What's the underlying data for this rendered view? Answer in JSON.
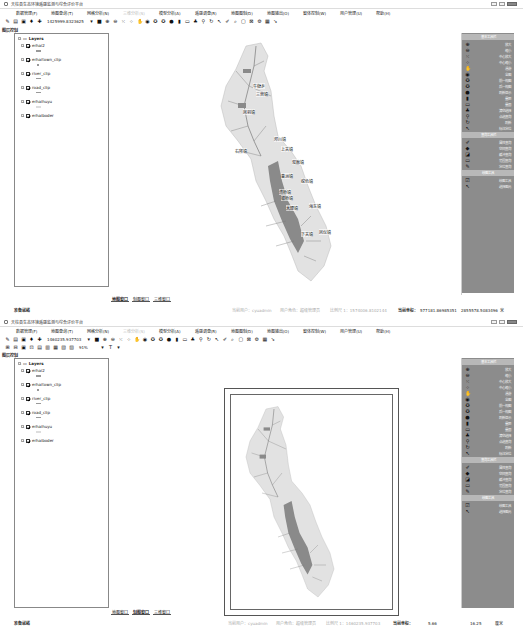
{
  "window": {
    "title": "天柱县生态环境遥感监测与综合评价平台",
    "controls": [
      "minimize",
      "maximize",
      "close"
    ]
  },
  "menubar": {
    "items": [
      {
        "label": "数据管理(F)",
        "disabled": false
      },
      {
        "label": "地图查询(T)",
        "disabled": false
      },
      {
        "label": "网格分析(N)",
        "disabled": false
      },
      {
        "label": "三维分析(S)",
        "disabled": true
      },
      {
        "label": "模型分析(A)",
        "disabled": false
      },
      {
        "label": "遥感调查(R)",
        "disabled": false
      },
      {
        "label": "地图图制(D)",
        "disabled": false
      },
      {
        "label": "地图输出(O)",
        "disabled": false
      },
      {
        "label": "窗体控制(W)",
        "disabled": false
      },
      {
        "label": "用户管理(U)",
        "disabled": false
      },
      {
        "label": "帮助(H)",
        "disabled": false
      }
    ]
  },
  "top_panel": {
    "coordinate_display": "1425999.8323625",
    "layer_panel_title": "图层控制",
    "layers_root": "Layers",
    "layers": [
      "erhai2",
      "erhaitown_clip",
      "river_clip",
      "road_clip",
      "erhaihuyu",
      "erhaiboder"
    ],
    "right_panel": {
      "section1_title": "基本工具栏",
      "section1_items": [
        "放大",
        "缩小",
        "中心放大",
        "中心缩小",
        "漫游",
        "全图",
        "前一视图",
        "后一视图",
        "刷新显示",
        "量距",
        "量面",
        "清空选择",
        "点选查询",
        "刷新",
        "标注定位"
      ],
      "section2_title": "查询工具栏",
      "section2_items": [
        "属性查询",
        "空间查询",
        "缓冲查询",
        "范围查询",
        "定位查询"
      ],
      "section3_title": "绘图工具",
      "section3_items": [
        "绘图工具",
        "选择图元"
      ]
    },
    "tabs": [
      "地图窗口",
      "制图窗口",
      "三维窗口"
    ],
    "active_tab": "地图窗口",
    "status": {
      "ready": "准备就绪",
      "user": "当前用户：cyuadmin",
      "role": "用户角色：超级管理员",
      "scale": "比例尺 1：1574006.8102144",
      "coord_label": "当前坐标：",
      "x": "577181.86985351",
      "y": "2855578.5083496",
      "unit": "米"
    },
    "map_labels": [
      "牛街乡",
      "三营镇",
      "凤羽镇",
      "茈碧湖",
      "右所镇",
      "邓川镇",
      "上关镇",
      "双廊镇",
      "喜洲镇",
      "挖色镇",
      "湾桥镇",
      "银桥镇",
      "大理镇",
      "海东镇",
      "凤仪镇",
      "下关镇"
    ]
  },
  "bottom_panel": {
    "coordinate_display": "1460235.937703",
    "zoom_level": "91%",
    "layer_panel_title": "图层控制",
    "layers_root": "Layers",
    "layers": [
      "erhai2",
      "erhaitown_clip",
      "river_clip",
      "road_clip",
      "erhaihuyu",
      "erhaiboder"
    ],
    "right_panel": {
      "section1_title": "基本工具栏",
      "section1_items": [
        "放大",
        "缩小",
        "中心放大",
        "中心缩小",
        "漫游",
        "全图",
        "前一视图",
        "后一视图",
        "刷新显示",
        "量距",
        "量面",
        "清空选择",
        "点选查询",
        "刷新",
        "标注定位"
      ],
      "section2_title": "查询工具栏",
      "section2_items": [
        "属性查询",
        "空间查询",
        "缓冲查询",
        "范围查询",
        "定位查询"
      ],
      "section3_title": "绘图工具",
      "section3_items": [
        "绘图工具",
        "选择图元"
      ]
    },
    "tabs": [
      "地图窗口",
      "制图窗口",
      "三维窗口"
    ],
    "active_tab": "制图窗口",
    "status": {
      "ready": "准备就绪",
      "user": "当前用户：cyuadmin",
      "role": "用户角色：超级管理员",
      "scale": "比例尺 1：1460235.937703",
      "coord_label": "当前坐标：",
      "x": "5.66",
      "y": "16.25",
      "unit": "厘米"
    }
  },
  "colors": {
    "right_panel_bg": "#8c8c8c",
    "right_panel_header": "#b8b8b8",
    "map_land": "#e2e2e2",
    "lake": "#8a8a8a",
    "river": "#6a6a6a"
  }
}
